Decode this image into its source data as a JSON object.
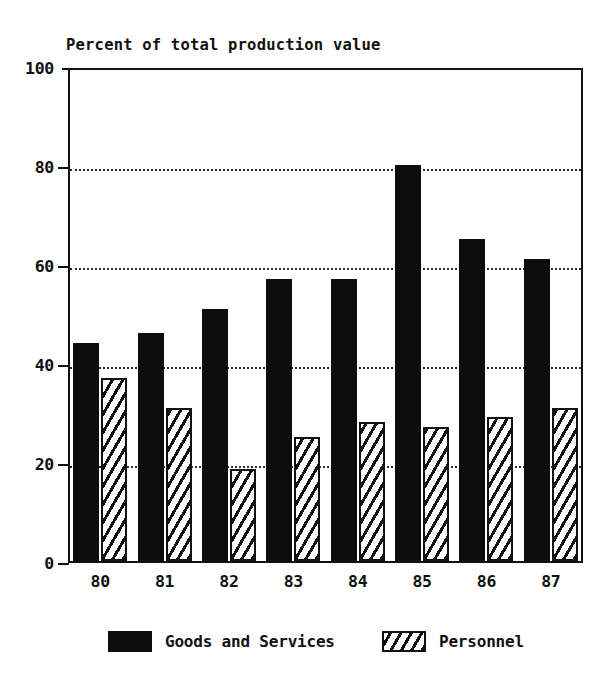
{
  "chart_data": {
    "type": "bar",
    "title": "Percent of total production value",
    "xlabel": "",
    "ylabel": "",
    "ylim": [
      0,
      100
    ],
    "yticks": [
      0,
      20,
      40,
      60,
      80,
      100
    ],
    "grid": "horizontal-dotted-at-20-40-60-80",
    "legend_position": "bottom-center",
    "categories": [
      "80",
      "81",
      "82",
      "83",
      "84",
      "85",
      "86",
      "87"
    ],
    "series": [
      {
        "name": "Goods and Services",
        "fill": "solid-black",
        "color": "#0d0d0d",
        "values": [
          44,
          46,
          51,
          57,
          57,
          80,
          65,
          61
        ]
      },
      {
        "name": "Personnel",
        "fill": "diagonal-hatch",
        "color": "#111111",
        "values": [
          37,
          31,
          18.5,
          25,
          28,
          27,
          29,
          31
        ]
      }
    ]
  },
  "legend": {
    "items": [
      {
        "label": "Goods and Services",
        "swatch": "solid"
      },
      {
        "label": "Personnel",
        "swatch": "hatch"
      }
    ]
  }
}
